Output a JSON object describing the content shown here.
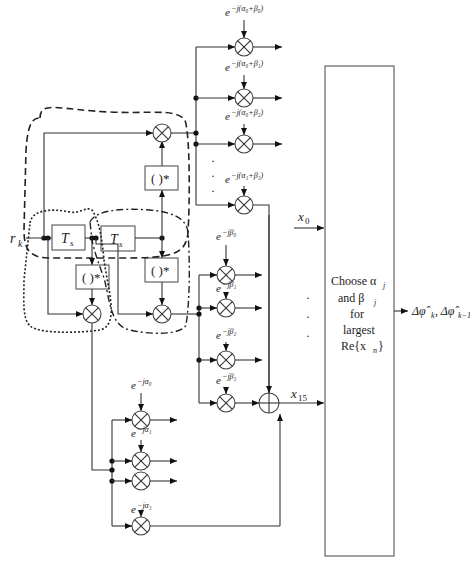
{
  "diagram": {
    "input_label": "r",
    "input_sub": "k",
    "delay_label": "T",
    "delay_sub": "s",
    "conj_label": "( )*",
    "top_phasors": [
      {
        "exp": "−j(α₀+β₀)"
      },
      {
        "exp": "−j(α₀+β₁)"
      },
      {
        "exp": "−j(α₀+β₂)"
      },
      {
        "exp": "−j(α₃+β₃)"
      }
    ],
    "beta_phasors": [
      {
        "exp": "−jβ₀"
      },
      {
        "exp": "−jβ₁"
      },
      {
        "exp": "−jβ₂"
      },
      {
        "exp": "−jβ₃"
      }
    ],
    "alpha_phasors": [
      {
        "exp": "−jα₀"
      },
      {
        "exp": "−jα₁"
      },
      {
        "exp": "−jα₂"
      },
      {
        "exp": "−jα₃"
      }
    ],
    "base": "e",
    "x0_label": "x",
    "x0_sub": "0",
    "x15_label": "x",
    "x15_sub": "15",
    "decision_box": {
      "line1": "Choose α",
      "line1_sub": "j",
      "line2": "and β",
      "line2_sub": "j",
      "line3": "for",
      "line4": "largest",
      "line5": "Re{x",
      "line5_sub": "n",
      "line5_end": "}"
    },
    "output_label": "Δφ̂",
    "output_sub1": "k",
    "output_sep": ", Δφ̂",
    "output_sub2": "k−1",
    "ellipsis": "·"
  }
}
